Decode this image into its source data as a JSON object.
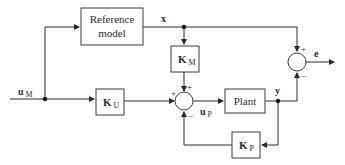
{
  "diagram": {
    "type": "block-diagram",
    "blocks": {
      "reference_model": {
        "line1": "Reference",
        "line2": "model"
      },
      "km": {
        "main": "K",
        "sub": "M"
      },
      "ku": {
        "main": "K",
        "sub": "U"
      },
      "plant": {
        "label": "Plant"
      },
      "kp": {
        "main": "K",
        "sub": "P"
      }
    },
    "signals": {
      "x": "x",
      "e": "e",
      "um": {
        "main": "u",
        "sub": "M"
      },
      "up": {
        "main": "u",
        "sub": "P"
      },
      "y": "y"
    },
    "summing_junctions": {
      "input_sum": {
        "signs": {
          "left": "+",
          "top": "+",
          "bottom": "−"
        }
      },
      "error_sum": {
        "signs": {
          "top": "+",
          "bottom": "−"
        }
      }
    },
    "colors": {
      "line": "#2a2a2a",
      "background": "#ffffff"
    }
  }
}
